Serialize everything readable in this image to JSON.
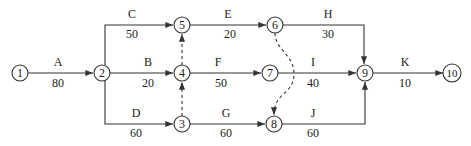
{
  "diagram": {
    "type": "activity-on-arrow network",
    "nodes": [
      {
        "id": "1",
        "label": "1",
        "x": 20,
        "y": 73
      },
      {
        "id": "2",
        "label": "2",
        "x": 102,
        "y": 73
      },
      {
        "id": "3",
        "label": "3",
        "x": 182,
        "y": 124
      },
      {
        "id": "4",
        "label": "4",
        "x": 182,
        "y": 73
      },
      {
        "id": "5",
        "label": "5",
        "x": 182,
        "y": 25
      },
      {
        "id": "6",
        "label": "6",
        "x": 275,
        "y": 25
      },
      {
        "id": "7",
        "label": "7",
        "x": 270,
        "y": 73
      },
      {
        "id": "8",
        "label": "8",
        "x": 274,
        "y": 124
      },
      {
        "id": "9",
        "label": "9",
        "x": 365,
        "y": 73
      },
      {
        "id": "10",
        "label": "10",
        "x": 452,
        "y": 73
      }
    ],
    "activities": [
      {
        "name": "A",
        "duration": "80",
        "from": "1",
        "to": "2"
      },
      {
        "name": "C",
        "duration": "50",
        "from": "2",
        "to": "5"
      },
      {
        "name": "B",
        "duration": "20",
        "from": "2",
        "to": "4"
      },
      {
        "name": "D",
        "duration": "60",
        "from": "2",
        "to": "3"
      },
      {
        "name": "E",
        "duration": "20",
        "from": "5",
        "to": "6"
      },
      {
        "name": "F",
        "duration": "50",
        "from": "4",
        "to": "7"
      },
      {
        "name": "G",
        "duration": "60",
        "from": "3",
        "to": "8"
      },
      {
        "name": "H",
        "duration": "30",
        "from": "6",
        "to": "9"
      },
      {
        "name": "I",
        "duration": "40",
        "from": "7",
        "to": "9"
      },
      {
        "name": "J",
        "duration": "60",
        "from": "8",
        "to": "9"
      },
      {
        "name": "K",
        "duration": "10",
        "from": "9",
        "to": "10"
      }
    ],
    "dummy_activities": [
      {
        "from": "4",
        "to": "5"
      },
      {
        "from": "3",
        "to": "4"
      },
      {
        "from": "6",
        "to": "8"
      }
    ]
  },
  "labels": {
    "A": "A",
    "A_d": "80",
    "B": "B",
    "B_d": "20",
    "C": "C",
    "C_d": "50",
    "D": "D",
    "D_d": "60",
    "E": "E",
    "E_d": "20",
    "F": "F",
    "F_d": "50",
    "G": "G",
    "G_d": "60",
    "H": "H",
    "H_d": "30",
    "I": "I",
    "I_d": "40",
    "J": "J",
    "J_d": "60",
    "K": "K",
    "K_d": "10",
    "n1": "1",
    "n2": "2",
    "n3": "3",
    "n4": "4",
    "n5": "5",
    "n6": "6",
    "n7": "7",
    "n8": "8",
    "n9": "9",
    "n10": "10"
  }
}
